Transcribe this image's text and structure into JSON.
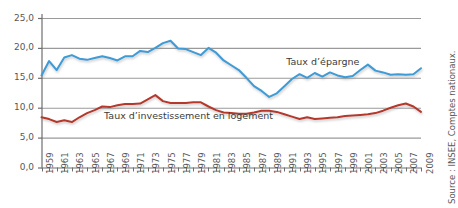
{
  "chart_data": {
    "type": "line",
    "title": "",
    "xlabel": "",
    "ylabel": "",
    "ylim": [
      0,
      25
    ],
    "yticks": [
      0,
      5,
      10,
      15,
      20,
      25
    ],
    "ytick_labels": [
      "0,0",
      "5,0",
      "10,0",
      "15,0",
      "20,0",
      "25,0"
    ],
    "grid": true,
    "legend_position": "inline-annotation",
    "x": [
      1959,
      1960,
      1961,
      1962,
      1963,
      1964,
      1965,
      1966,
      1967,
      1968,
      1969,
      1970,
      1971,
      1972,
      1973,
      1974,
      1975,
      1976,
      1977,
      1978,
      1979,
      1980,
      1981,
      1982,
      1983,
      1984,
      1985,
      1986,
      1987,
      1988,
      1989,
      1990,
      1991,
      1992,
      1993,
      1994,
      1995,
      1996,
      1997,
      1998,
      1999,
      2000,
      2001,
      2002,
      2003,
      2004,
      2005,
      2006,
      2007,
      2008,
      2009
    ],
    "xtick_labels": [
      "1959",
      "1961",
      "1963",
      "1965",
      "1967",
      "1969",
      "1971",
      "1973",
      "1975",
      "1977",
      "1979",
      "1981",
      "1983",
      "1985",
      "1987",
      "1989",
      "1991",
      "1993",
      "1995",
      "1997",
      "1999",
      "2001",
      "2003",
      "2005",
      "2007",
      "2009"
    ],
    "xtick_step": 2,
    "series": [
      {
        "name": "Taux d’épargne",
        "color": "#3d9bd6",
        "label_x_frac": 0.645,
        "label_y_value": 17.6,
        "values": [
          15.4,
          17.8,
          16.3,
          18.4,
          18.8,
          18.2,
          18.0,
          18.3,
          18.6,
          18.3,
          17.9,
          18.6,
          18.6,
          19.5,
          19.3,
          20.0,
          20.8,
          21.2,
          19.9,
          19.8,
          19.3,
          18.8,
          20.0,
          19.2,
          17.9,
          17.1,
          16.3,
          15.0,
          13.6,
          12.8,
          11.8,
          12.4,
          13.6,
          14.8,
          15.6,
          15.0,
          15.8,
          15.2,
          15.9,
          15.4,
          15.1,
          15.3,
          16.3,
          17.2,
          16.2,
          15.9,
          15.5,
          15.6,
          15.5,
          15.6,
          16.6
        ]
      },
      {
        "name": "Taux d’investissement en logement",
        "color": "#b5392c",
        "label_x_frac": 0.165,
        "label_y_value": 8.6,
        "values": [
          8.4,
          8.1,
          7.6,
          7.9,
          7.6,
          8.4,
          9.1,
          9.6,
          10.2,
          10.1,
          10.4,
          10.6,
          10.6,
          10.7,
          11.4,
          12.1,
          11.1,
          10.8,
          10.8,
          10.8,
          10.9,
          10.9,
          10.2,
          9.6,
          9.2,
          9.1,
          9.0,
          9.0,
          9.2,
          9.5,
          9.5,
          9.3,
          8.9,
          8.5,
          8.1,
          8.4,
          8.1,
          8.2,
          8.3,
          8.4,
          8.6,
          8.7,
          8.8,
          8.9,
          9.1,
          9.5,
          10.0,
          10.4,
          10.7,
          10.2,
          9.3
        ]
      }
    ],
    "source": "Source : INSEE, Comptes nationaux."
  }
}
